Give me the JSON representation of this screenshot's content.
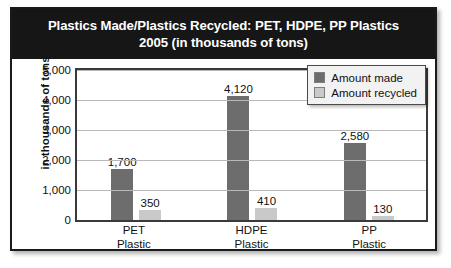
{
  "chart_data": {
    "type": "bar",
    "title": "Plastics Made/Plastics Recycled: PET, HDPE, PP Plastics\n2005 (in thousands of tons)",
    "xlabel": "",
    "ylabel": "in thousands of tons",
    "ylim": [
      0,
      5000
    ],
    "ytick_labels": [
      "0",
      "1,000",
      "2,000",
      "3,000",
      "4,000",
      "5,000"
    ],
    "ytick_values": [
      0,
      1000,
      2000,
      3000,
      4000,
      5000
    ],
    "grid": true,
    "legend_position": "top-right",
    "categories": [
      "PET\nPlastic",
      "HDPE\nPlastic",
      "PP\nPlastic"
    ],
    "series": [
      {
        "name": "Amount made",
        "color": "#6d6d6d",
        "values": [
          1700,
          4120,
          2580
        ],
        "value_labels": [
          "1,700",
          "4,120",
          "2,580"
        ]
      },
      {
        "name": "Amount recycled",
        "color": "#c9c9c9",
        "values": [
          350,
          410,
          130
        ],
        "value_labels": [
          "350",
          "410",
          "130"
        ]
      }
    ]
  },
  "legend": {
    "items": [
      {
        "label": "Amount made",
        "color": "#6d6d6d"
      },
      {
        "label": "Amount recycled",
        "color": "#c9c9c9"
      }
    ]
  },
  "colors": {
    "title_background": "#161616",
    "title_text": "#ffffff",
    "frame_border": "#1a1a1a",
    "plot_border": "#3a3a3a",
    "gridline": "#b9b9b9",
    "made_bar": "#6d6d6d",
    "recycled_bar": "#c9c9c9",
    "legend_background": "#f2f2f2"
  }
}
